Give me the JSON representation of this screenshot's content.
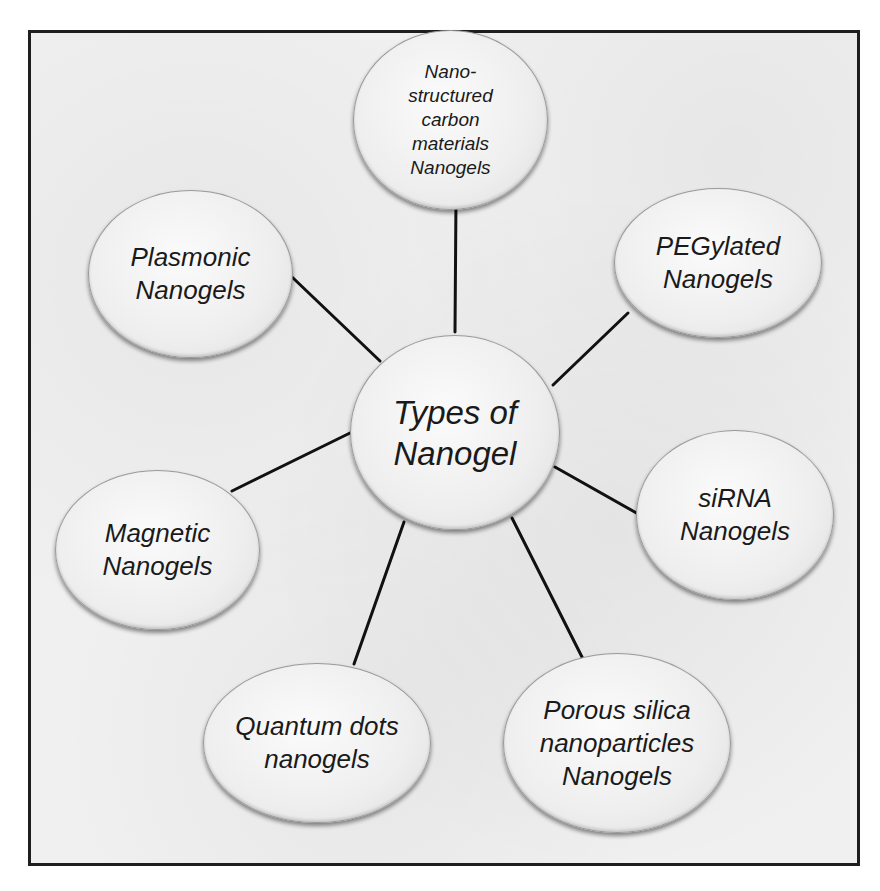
{
  "diagram": {
    "center": {
      "label": "Types of\nNanogel"
    },
    "nodes": [
      {
        "id": "carbon",
        "label": "Nano-\nstructured\ncarbon\nmaterials\nNanogels"
      },
      {
        "id": "pegylated",
        "label": "PEGylated\nNanogels"
      },
      {
        "id": "sirna",
        "label": "siRNA\nNanogels"
      },
      {
        "id": "silica",
        "label": "Porous silica\nnanoparticles\nNanogels"
      },
      {
        "id": "quantum",
        "label": "Quantum dots\nnanogels"
      },
      {
        "id": "magnetic",
        "label": "Magnetic\nNanogels"
      },
      {
        "id": "plasmonic",
        "label": "Plasmonic\nNanogels"
      }
    ],
    "colors": {
      "line": "#111111",
      "frame": "#1e1e1e",
      "background": "#f0f0f0",
      "text": "#1a1a1a"
    }
  }
}
